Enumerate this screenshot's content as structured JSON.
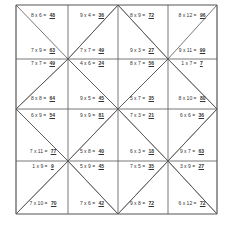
{
  "worksheet": {
    "title": "",
    "problems": [
      {
        "expr": "8 x 6 =",
        "answer": "48"
      },
      {
        "expr": "9 x 4 =",
        "answer": "36"
      },
      {
        "expr": "8 x 9 =",
        "answer": "72"
      },
      {
        "expr": "8 x 12 =",
        "answer": "96"
      },
      {
        "expr": "7 x 9 =",
        "answer": "63"
      },
      {
        "expr": "7 x 7 =",
        "answer": "49"
      },
      {
        "expr": "9 x 3 =",
        "answer": "27"
      },
      {
        "expr": "9 x 11 =",
        "answer": "99"
      },
      {
        "expr": "7 x 7 =",
        "answer": "49"
      },
      {
        "expr": "4 x 6 =",
        "answer": "24"
      },
      {
        "expr": "8 x 7 =",
        "answer": "56"
      },
      {
        "expr": "1 x 7 =",
        "answer": "7"
      },
      {
        "expr": "8 x 8 =",
        "answer": "64"
      },
      {
        "expr": "9 x 5 =",
        "answer": "45"
      },
      {
        "expr": "5 x 7 =",
        "answer": "35"
      },
      {
        "expr": "8 x 10 =",
        "answer": "80"
      },
      {
        "expr": "6 x 9 =",
        "answer": "54"
      },
      {
        "expr": "9 x 9 =",
        "answer": "81"
      },
      {
        "expr": "7 x 3 =",
        "answer": "21"
      },
      {
        "expr": "6 x 6 =",
        "answer": "36"
      },
      {
        "expr": "7 x 11 =",
        "answer": "77"
      },
      {
        "expr": "5 x 8 =",
        "answer": "40"
      },
      {
        "expr": "6 x 3 =",
        "answer": "18"
      },
      {
        "expr": "9 x 7 =",
        "answer": "63"
      },
      {
        "expr": "1 x 9 =",
        "answer": "9"
      },
      {
        "expr": "5 x 9 =",
        "answer": "45"
      },
      {
        "expr": "7 x 5 =",
        "answer": "35"
      },
      {
        "expr": "3 x 9 =",
        "answer": "27"
      },
      {
        "expr": "7 x 10 =",
        "answer": "70"
      },
      {
        "expr": "7 x 6 =",
        "answer": "42"
      },
      {
        "expr": "9 x 8 =",
        "answer": "72"
      },
      {
        "expr": "6 x 12 =",
        "answer": "72"
      }
    ]
  }
}
